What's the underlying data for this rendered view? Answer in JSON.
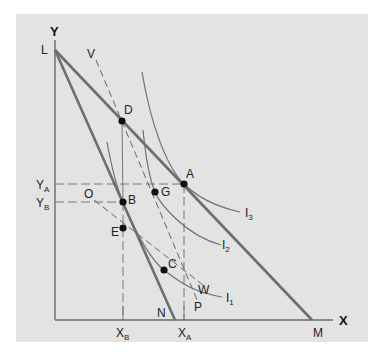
{
  "diagram": {
    "type": "indifference-curve-budget-line",
    "axes": {
      "y_label": "Y",
      "x_label": "X"
    },
    "colors": {
      "background": "#e3e3e3",
      "budget_line": "#6e6e6e",
      "curve": "#707070",
      "axis": "#6a6a6a",
      "point": "#111111"
    },
    "lines": {
      "budget_LM": {
        "from": "L",
        "to": "M"
      },
      "budget_LN": {
        "from": "L",
        "to": "N"
      },
      "compensating_VP": {
        "from": "V",
        "to": "P",
        "style": "dashed"
      },
      "compensating_OW": {
        "from": "O",
        "to": "W",
        "style": "dashed"
      }
    },
    "labels": {
      "L": "L",
      "M": "M",
      "N": "N",
      "V": "V",
      "P": "P",
      "O": "O",
      "W": "W",
      "D": "D",
      "A": "A",
      "G": "G",
      "B": "B",
      "E": "E",
      "C": "C",
      "I1": "I",
      "I1_sub": "1",
      "I2": "I",
      "I2_sub": "2",
      "I3": "I",
      "I3_sub": "3",
      "YA": "Y",
      "YA_sub": "A",
      "YB": "Y",
      "YB_sub": "B",
      "XB": "X",
      "XB_sub": "B",
      "XA": "X",
      "XA_sub": "A"
    },
    "points": [
      {
        "name": "D",
        "x": 122,
        "y": 121
      },
      {
        "name": "A",
        "x": 184,
        "y": 184
      },
      {
        "name": "G",
        "x": 155,
        "y": 192
      },
      {
        "name": "B",
        "x": 123,
        "y": 202
      },
      {
        "name": "E",
        "x": 123,
        "y": 228
      },
      {
        "name": "C",
        "x": 164,
        "y": 270
      }
    ],
    "indifference_curves": [
      "I1",
      "I2",
      "I3"
    ]
  }
}
